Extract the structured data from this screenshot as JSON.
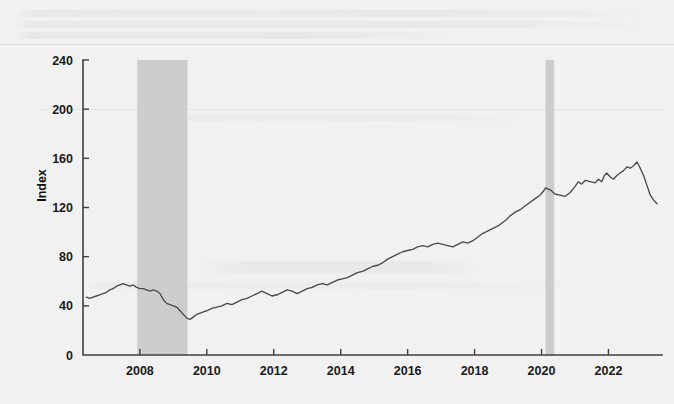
{
  "figure": {
    "background_color": "#f2f2f2",
    "plot_background_color": "#f0f0f0"
  },
  "chart_data": {
    "type": "line",
    "title": "",
    "subtitle": "",
    "xlabel": "",
    "ylabel": "Index",
    "xlim": [
      2006.3,
      2023.6
    ],
    "ylim": [
      0,
      240
    ],
    "xticks": [
      2008,
      2010,
      2012,
      2014,
      2016,
      2018,
      2020,
      2022
    ],
    "xtick_labels": [
      "2008",
      "2010",
      "2012",
      "2014",
      "2016",
      "2018",
      "2020",
      "2022"
    ],
    "yticks": [
      0,
      40,
      80,
      120,
      160,
      200,
      240
    ],
    "ytick_labels": [
      "0",
      "40",
      "80",
      "120",
      "160",
      "200",
      "240"
    ],
    "grid": false,
    "legend": "none",
    "line_color": "#4a4a4a",
    "shading_color": "#cdcdcd",
    "series": [
      {
        "name": "Index",
        "x": [
          2006.4,
          2006.5,
          2006.6,
          2006.7,
          2006.8,
          2006.9,
          2007.0,
          2007.1,
          2007.2,
          2007.3,
          2007.4,
          2007.5,
          2007.6,
          2007.7,
          2007.8,
          2007.9,
          2008.0,
          2008.1,
          2008.2,
          2008.3,
          2008.4,
          2008.5,
          2008.6,
          2008.7,
          2008.8,
          2008.9,
          2009.0,
          2009.1,
          2009.2,
          2009.3,
          2009.4,
          2009.5,
          2009.6,
          2009.7,
          2009.8,
          2009.9,
          2010.0,
          2010.15,
          2010.3,
          2010.45,
          2010.6,
          2010.75,
          2010.9,
          2011.05,
          2011.2,
          2011.35,
          2011.5,
          2011.65,
          2011.8,
          2011.95,
          2012.1,
          2012.25,
          2012.4,
          2012.55,
          2012.7,
          2012.85,
          2013.0,
          2013.15,
          2013.3,
          2013.45,
          2013.6,
          2013.75,
          2013.9,
          2014.05,
          2014.2,
          2014.35,
          2014.5,
          2014.65,
          2014.8,
          2014.95,
          2015.1,
          2015.25,
          2015.4,
          2015.55,
          2015.7,
          2015.85,
          2016.0,
          2016.15,
          2016.3,
          2016.45,
          2016.6,
          2016.75,
          2016.9,
          2017.05,
          2017.2,
          2017.35,
          2017.5,
          2017.65,
          2017.8,
          2017.95,
          2018.05,
          2018.15,
          2018.25,
          2018.4,
          2018.55,
          2018.7,
          2018.85,
          2018.95,
          2019.05,
          2019.2,
          2019.35,
          2019.5,
          2019.65,
          2019.8,
          2019.95,
          2020.05,
          2020.12,
          2020.2,
          2020.28,
          2020.4,
          2020.55,
          2020.7,
          2020.85,
          2021.0,
          2021.1,
          2021.2,
          2021.3,
          2021.45,
          2021.6,
          2021.7,
          2021.8,
          2021.88,
          2021.95,
          2022.05,
          2022.15,
          2022.25,
          2022.35,
          2022.45,
          2022.55,
          2022.65,
          2022.75,
          2022.85,
          2022.95,
          2023.05,
          2023.15,
          2023.25,
          2023.35,
          2023.45
        ],
        "y": [
          47,
          46,
          47,
          48,
          49,
          50,
          51,
          53,
          54,
          56,
          57,
          58,
          57,
          56,
          57,
          55,
          54,
          54,
          53,
          52,
          53,
          52,
          50,
          45,
          42,
          41,
          40,
          39,
          36,
          33,
          30,
          29,
          31,
          33,
          34,
          35,
          36,
          38,
          39,
          40,
          42,
          41,
          43,
          45,
          46,
          48,
          50,
          52,
          50,
          48,
          49,
          51,
          53,
          52,
          50,
          52,
          54,
          55,
          57,
          58,
          57,
          59,
          61,
          62,
          63,
          65,
          67,
          68,
          70,
          72,
          73,
          75,
          78,
          80,
          82,
          84,
          85,
          86,
          88,
          89,
          88,
          90,
          91,
          90,
          89,
          88,
          90,
          92,
          91,
          93,
          95,
          97,
          99,
          101,
          103,
          105,
          108,
          110,
          113,
          116,
          118,
          121,
          124,
          127,
          130,
          133,
          136,
          135,
          134,
          131,
          130,
          129,
          132,
          137,
          141,
          139,
          142,
          141,
          140,
          143,
          141,
          146,
          148,
          145,
          143,
          146,
          148,
          150,
          153,
          152,
          154,
          157,
          152,
          146,
          138,
          130,
          126,
          123
        ]
      }
    ],
    "shaded_regions": [
      {
        "name": "great-recession",
        "start": 2007.92,
        "end": 2009.42,
        "label": ""
      },
      {
        "name": "covid-recession",
        "start": 2020.12,
        "end": 2020.38,
        "label": ""
      }
    ]
  },
  "series_tail": {
    "x": [
      2020.15,
      2020.25,
      2020.32,
      2020.4,
      2020.48,
      2020.56,
      2020.64,
      2020.72,
      2020.8,
      2020.88,
      2020.96,
      2021.04,
      2021.12,
      2021.2,
      2021.28,
      2021.36,
      2021.44,
      2021.52,
      2021.6,
      2021.68,
      2021.76,
      2021.82,
      2021.88,
      2021.94,
      2022.0,
      2022.06,
      2022.12,
      2022.18,
      2022.24,
      2022.3,
      2022.36,
      2022.42,
      2022.48,
      2022.54,
      2022.6,
      2022.66,
      2022.72,
      2022.78,
      2022.84,
      2022.9,
      2022.96,
      2023.04,
      2023.12,
      2023.2,
      2023.28,
      2023.36,
      2023.44
    ],
    "y": [
      123,
      133,
      137,
      145,
      143,
      152,
      156,
      159,
      158,
      166,
      172,
      178,
      177,
      186,
      193,
      199,
      207,
      214,
      222,
      228,
      226,
      234,
      229,
      238,
      231,
      226,
      222,
      211,
      200,
      206,
      197,
      206,
      195,
      204,
      190,
      200,
      181,
      191,
      188,
      196,
      194,
      198,
      205,
      203,
      210,
      219,
      228
    ]
  }
}
